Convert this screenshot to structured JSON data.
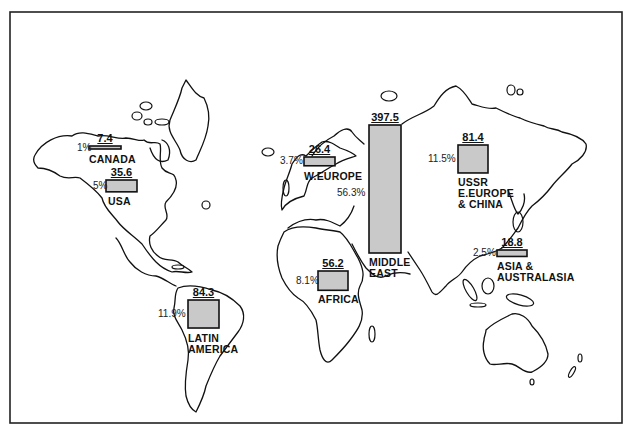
{
  "chart_data": {
    "type": "map-bar",
    "title": "",
    "value_unit": "",
    "regions": [
      {
        "key": "canada",
        "name_lines": [
          "CANADA"
        ],
        "value": 7.4,
        "value_label": "7.4",
        "percent": 1.0,
        "percent_label": "1%"
      },
      {
        "key": "usa",
        "name_lines": [
          "USA"
        ],
        "value": 35.6,
        "value_label": "35.6",
        "percent": 5.0,
        "percent_label": "5%"
      },
      {
        "key": "w_europe",
        "name_lines": [
          "W.EUROPE"
        ],
        "value": 26.4,
        "value_label": "26.4",
        "percent": 3.7,
        "percent_label": "3.7%"
      },
      {
        "key": "middle_east",
        "name_lines": [
          "MIDDLE",
          "EAST"
        ],
        "value": 397.5,
        "value_label": "397.5",
        "percent": 56.3,
        "percent_label": "56.3%"
      },
      {
        "key": "ussr",
        "name_lines": [
          "USSR",
          "E.EUROPE",
          "& CHINA"
        ],
        "value": 81.4,
        "value_label": "81.4",
        "percent": 11.5,
        "percent_label": "11.5%"
      },
      {
        "key": "asia",
        "name_lines": [
          "ASIA &",
          "AUSTRALASIA"
        ],
        "value": 18.8,
        "value_label": "18.8",
        "percent": 2.5,
        "percent_label": "2.5%"
      },
      {
        "key": "africa",
        "name_lines": [
          "AFRICA"
        ],
        "value": 56.2,
        "value_label": "56.2",
        "percent": 8.1,
        "percent_label": "8.1%"
      },
      {
        "key": "latin_america",
        "name_lines": [
          "LATIN",
          "AMERICA"
        ],
        "value": 84.3,
        "value_label": "84.3",
        "percent": 11.9,
        "percent_label": "11.9%"
      }
    ],
    "colors": {
      "bar_fill": "#c9c9c9",
      "outline": "#111111",
      "background": "#ffffff"
    }
  }
}
